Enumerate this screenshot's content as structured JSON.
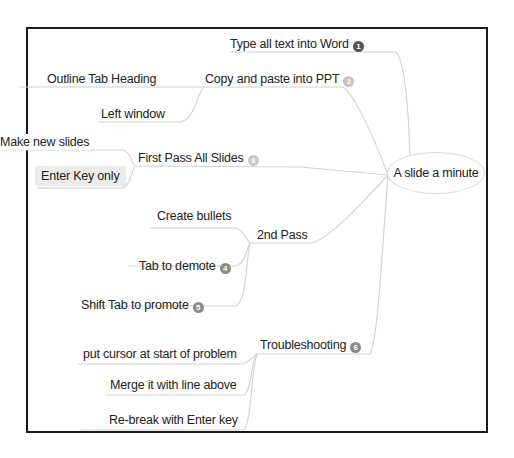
{
  "mindmap": {
    "root": {
      "label": "A slide a minute"
    },
    "branches": [
      {
        "label": "Type all text into Word",
        "badge": "1",
        "badge_color": "#555555",
        "children": []
      },
      {
        "label": "Copy and paste into PPT",
        "badge": "2",
        "badge_color": "#c4c4c4",
        "children": [
          {
            "label": "Outline Tab Heading"
          },
          {
            "label": "Left window"
          }
        ]
      },
      {
        "label": "First Pass All Slides",
        "badge": "3",
        "badge_color": "#c8c8c8",
        "children": [
          {
            "label": "Make new slides"
          },
          {
            "label": "Enter Key only",
            "selected": true
          }
        ]
      },
      {
        "label": "2nd Pass",
        "children": [
          {
            "label": "Create bullets"
          },
          {
            "label": "Tab to demote",
            "badge": "4",
            "badge_color": "#8a8a8a"
          },
          {
            "label": "Shift Tab to promote",
            "badge": "5",
            "badge_color": "#8a8a8a"
          }
        ]
      },
      {
        "label": "Troubleshooting",
        "badge": "6",
        "badge_color": "#8a8a8a",
        "children": [
          {
            "label": "put cursor at start of problem"
          },
          {
            "label": "Merge it with line above"
          },
          {
            "label": "Re-break with Enter key"
          }
        ]
      }
    ]
  },
  "colors": {
    "frame_border": "#1a1a1a",
    "connector": "#d0d0d0",
    "selected_bg": "#ebebeb"
  }
}
